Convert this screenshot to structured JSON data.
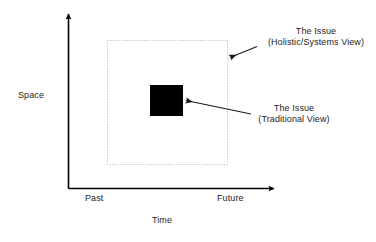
{
  "diagram": {
    "axes": {
      "y_axis": {
        "name": "space-axis",
        "label": "Space",
        "arrow": "up"
      },
      "x_axis": {
        "name": "time-axis",
        "label": "Time",
        "arrow": "right",
        "start_tick_label": "Past",
        "end_tick_label": "Future"
      }
    },
    "shapes": {
      "holistic_box": {
        "name": "holistic-systems-boundary",
        "style": "dotted-rectangle",
        "stroke": "#BFBFBF"
      },
      "traditional_box": {
        "name": "traditional-issue-block",
        "style": "filled-rectangle",
        "fill": "#000000"
      }
    },
    "callouts": [
      {
        "name": "holistic-callout",
        "line1": "The Issue",
        "line2": "(Holistic/Systems View)",
        "arrow_target": "holistic-systems-boundary"
      },
      {
        "name": "traditional-callout",
        "line1": "The Issue",
        "line2": "(Traditional View)",
        "arrow_target": "traditional-issue-block"
      }
    ],
    "colors": {
      "background": "#ffffff",
      "axis": "#000000",
      "text": "#262626",
      "dotted_border": "#BFBFBF",
      "block_fill": "#000000",
      "arrow": "#1a1a1a"
    }
  }
}
